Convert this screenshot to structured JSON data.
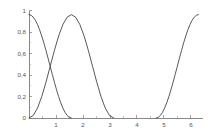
{
  "chart_data": {
    "type": "line",
    "title": "",
    "subtitle": "",
    "xlabel": "",
    "ylabel": "",
    "xlim": [
      0,
      6.45
    ],
    "ylim": [
      0,
      1.04
    ],
    "grid": false,
    "legend": false,
    "legend_position": "none",
    "decimal_separator": ",",
    "xticks": [
      1,
      2,
      3,
      4,
      5,
      6
    ],
    "xtick_labels": [
      "1",
      "2",
      "3",
      "4",
      "5",
      "6"
    ],
    "yticks": [
      0,
      0.2,
      0.4,
      0.6,
      0.8,
      1
    ],
    "ytick_labels": [
      "0",
      "0,2",
      "0,4",
      "0,6",
      "0,8",
      "1"
    ],
    "annotations": [],
    "series": [
      {
        "name": "curve-1",
        "formula": "cos(x)^2",
        "domain": [
          0,
          1.5708
        ],
        "color": "#3a3a3a",
        "points": [
          [
            0.0,
            1.0
          ],
          [
            0.0785,
            0.9939
          ],
          [
            0.1571,
            0.9755
          ],
          [
            0.2356,
            0.9455
          ],
          [
            0.3142,
            0.9045
          ],
          [
            0.3927,
            0.8536
          ],
          [
            0.4712,
            0.7939
          ],
          [
            0.5498,
            0.727
          ],
          [
            0.6283,
            0.6545
          ],
          [
            0.7069,
            0.5782
          ],
          [
            0.7854,
            0.5
          ],
          [
            0.8639,
            0.4218
          ],
          [
            0.9425,
            0.3455
          ],
          [
            1.021,
            0.273
          ],
          [
            1.0996,
            0.2061
          ],
          [
            1.1781,
            0.1464
          ],
          [
            1.2566,
            0.0955
          ],
          [
            1.3352,
            0.0545
          ],
          [
            1.4137,
            0.0245
          ],
          [
            1.4923,
            0.0061
          ],
          [
            1.5708,
            0.0
          ]
        ]
      },
      {
        "name": "curve-2",
        "formula": "sin(x)^2",
        "domain": [
          0,
          3.1416
        ],
        "color": "#3a3a3a",
        "points": [
          [
            0.0,
            0.0
          ],
          [
            0.1571,
            0.0245
          ],
          [
            0.3142,
            0.0955
          ],
          [
            0.4712,
            0.2061
          ],
          [
            0.6283,
            0.3455
          ],
          [
            0.7854,
            0.5
          ],
          [
            0.9425,
            0.6545
          ],
          [
            1.0996,
            0.7939
          ],
          [
            1.2566,
            0.9045
          ],
          [
            1.4137,
            0.9755
          ],
          [
            1.5708,
            1.0
          ],
          [
            1.7279,
            0.9755
          ],
          [
            1.885,
            0.9045
          ],
          [
            2.042,
            0.7939
          ],
          [
            2.1991,
            0.6545
          ],
          [
            2.3562,
            0.5
          ],
          [
            2.5133,
            0.3455
          ],
          [
            2.6704,
            0.2061
          ],
          [
            2.8274,
            0.0955
          ],
          [
            2.9845,
            0.0245
          ],
          [
            3.1416,
            0.0
          ]
        ]
      },
      {
        "name": "curve-3",
        "formula": "cos(x)^2",
        "domain": [
          4.7124,
          6.2832
        ],
        "color": "#3a3a3a",
        "points": [
          [
            4.7124,
            0.0
          ],
          [
            4.791,
            0.0061
          ],
          [
            4.8695,
            0.0245
          ],
          [
            4.948,
            0.0545
          ],
          [
            5.0265,
            0.0955
          ],
          [
            5.1051,
            0.1464
          ],
          [
            5.1836,
            0.2061
          ],
          [
            5.2622,
            0.273
          ],
          [
            5.3407,
            0.3455
          ],
          [
            5.4192,
            0.4218
          ],
          [
            5.4978,
            0.5
          ],
          [
            5.5763,
            0.5782
          ],
          [
            5.6549,
            0.6545
          ],
          [
            5.7334,
            0.727
          ],
          [
            5.8119,
            0.7939
          ],
          [
            5.8905,
            0.8536
          ],
          [
            5.969,
            0.9045
          ],
          [
            6.0476,
            0.9455
          ],
          [
            6.1261,
            0.9755
          ],
          [
            6.2046,
            0.9939
          ],
          [
            6.2832,
            1.0
          ]
        ]
      }
    ]
  },
  "axes": {
    "y_axis_name": "y-axis",
    "x_axis_name": "x-axis"
  }
}
